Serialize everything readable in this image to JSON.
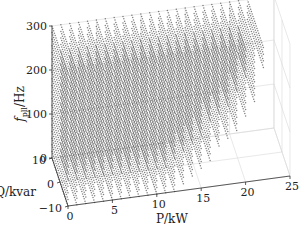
{
  "chart_data": {
    "type": "scatter",
    "subtype": "3d-scatter",
    "title": "",
    "xlabel": "P/kW",
    "ylabel": "Q/kvar",
    "zlabel": "f_pll/Hz",
    "xlim": [
      0,
      25
    ],
    "ylim": [
      -10,
      10
    ],
    "zlim": [
      0,
      300
    ],
    "xticks": [
      0,
      5,
      10,
      15,
      20,
      25
    ],
    "yticks": [
      -10,
      0,
      10
    ],
    "zticks": [
      0,
      100,
      200,
      300
    ],
    "grid": true,
    "legend": null,
    "series": [
      {
        "name": "feasible operating points",
        "marker": "dot",
        "color": "#1a1a1a",
        "description": "Dense grid of points filling region P in [0, ~22] kW, Q in [-10, 10] kvar, f_pll in [0, 300] Hz; right boundary curves inward at low frequency (max P decreases from ~22 kW at high f to ~12 kW near f=0)",
        "grid_steps": {
          "P": 1,
          "Q": 1,
          "f": 15
        },
        "p_max_at_f": [
          [
            0,
            12
          ],
          [
            30,
            14
          ],
          [
            60,
            16
          ],
          [
            100,
            18.5
          ],
          [
            150,
            20.5
          ],
          [
            200,
            21.5
          ],
          [
            250,
            22
          ],
          [
            300,
            22
          ]
        ]
      }
    ]
  },
  "axes_labels": {
    "x": "P/kW",
    "y": "Q/kvar",
    "z_main": "f",
    "z_sub": "pll",
    "z_unit": "/Hz"
  },
  "colors": {
    "dot": "#1a1a1a",
    "axis": "#333333",
    "grid": "#d9d9d9",
    "background": "#ffffff"
  }
}
